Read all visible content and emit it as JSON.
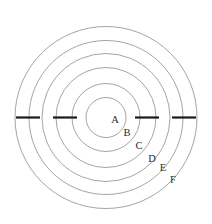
{
  "figure": {
    "background_color": "#ffffff",
    "ring_stroke_color": "#9a9a9a",
    "tick_color": "#1a1a1a",
    "label_color": "#2b2b2b",
    "center": {
      "x": 106,
      "y": 117.5
    }
  },
  "chart_data": {
    "type": "diagram",
    "title": "",
    "xlabel": "",
    "ylabel": "",
    "grid": false,
    "legend": "none",
    "center": {
      "x": 106,
      "y": 117.5
    },
    "rings": [
      {
        "label": "A",
        "radius": 20,
        "label_x": 115,
        "label_y": 121
      },
      {
        "label": "B",
        "radius": 34,
        "label_x": 127,
        "label_y": 134
      },
      {
        "label": "C",
        "radius": 50,
        "label_x": 139,
        "label_y": 147
      },
      {
        "label": "D",
        "radius": 64,
        "label_x": 152,
        "label_y": 160
      },
      {
        "label": "E",
        "radius": 77,
        "label_x": 163,
        "label_y": 169
      },
      {
        "label": "F",
        "radius": 91,
        "label_x": 173,
        "label_y": 181
      }
    ],
    "tick_segments": [
      {
        "name": "tick-left-outer",
        "x1": 16,
        "x2": 40,
        "y": 117.5
      },
      {
        "name": "tick-left-inner",
        "x1": 53,
        "x2": 77,
        "y": 117.5
      },
      {
        "name": "tick-right-inner",
        "x1": 135,
        "x2": 159,
        "y": 117.5
      },
      {
        "name": "tick-right-outer",
        "x1": 172,
        "x2": 196,
        "y": 117.5
      }
    ]
  }
}
